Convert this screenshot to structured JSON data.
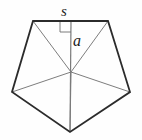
{
  "figure": {
    "type": "geometry-diagram",
    "canvas": {
      "width": 142,
      "height": 140
    },
    "background_color": "#fefefe",
    "colors": {
      "outline": "#2b2b2b",
      "inner_lines": "#6e6e6e",
      "apothem_line": "#7a7a7a",
      "right_angle_marker": "#6e6e6e",
      "label_text": "#1b1b1b"
    },
    "stroke_widths": {
      "outline": 1.8,
      "inner_lines": 0.9,
      "apothem_line": 1.2,
      "right_angle_marker": 0.9
    },
    "polygon": {
      "name": "regular-pentagon",
      "sides": 5,
      "center": {
        "x": 71,
        "y": 72
      },
      "vertices": [
        {
          "name": "top-left",
          "x": 33,
          "y": 21
        },
        {
          "name": "top-right",
          "x": 108,
          "y": 21
        },
        {
          "name": "right",
          "x": 130,
          "y": 92
        },
        {
          "name": "bottom",
          "x": 70,
          "y": 132
        },
        {
          "name": "left",
          "x": 12,
          "y": 92
        }
      ],
      "points_attr": "33,21 108,21 130,92 70,132 12,92"
    },
    "radii": [
      {
        "name": "radius-to-top-left",
        "x1": 71,
        "y1": 72,
        "x2": 33,
        "y2": 21
      },
      {
        "name": "radius-to-top-right",
        "x1": 71,
        "y1": 72,
        "x2": 108,
        "y2": 21
      },
      {
        "name": "radius-to-right",
        "x1": 71,
        "y1": 72,
        "x2": 130,
        "y2": 92
      },
      {
        "name": "radius-to-bottom",
        "x1": 71,
        "y1": 72,
        "x2": 70,
        "y2": 132
      },
      {
        "name": "radius-to-left",
        "x1": 71,
        "y1": 72,
        "x2": 12,
        "y2": 92
      }
    ],
    "apothem": {
      "label": "a",
      "description": "perpendicular segment from center to midpoint of top side, drawn through to bottom vertex",
      "x1": 71,
      "y1": 21,
      "x2": 70,
      "y2": 132
    },
    "side": {
      "label": "s",
      "description": "top side of the pentagon",
      "x1": 33,
      "y1": 21,
      "x2": 108,
      "y2": 21
    },
    "right_angle_marker": {
      "name": "right-angle-square",
      "description": "small square marking the 90 degree angle between apothem and top side",
      "path": "M 60,21 L 60,32 L 71,32"
    }
  }
}
